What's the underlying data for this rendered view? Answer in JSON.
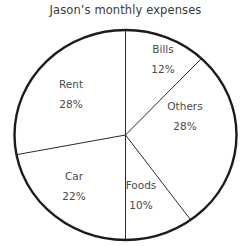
{
  "chart_data": {
    "type": "pie",
    "title": "Jason’s monthly expenses",
    "xlabel": "",
    "ylabel": "",
    "legend": "none",
    "grid": false,
    "start_angle_deg": 0,
    "direction": "clockwise",
    "units": "percent",
    "categories": [
      "Bills",
      "Others",
      "Foods",
      "Car",
      "Rent"
    ],
    "values": [
      12,
      28,
      10,
      22,
      28
    ],
    "value_suffix": "%",
    "total": 100,
    "slices": [
      {
        "name": "Bills",
        "value": 12,
        "value_label": "12%",
        "start_deg": 0,
        "end_deg": 43.2,
        "label_x": 163,
        "label_y": 44,
        "fill": "#ffffff"
      },
      {
        "name": "Others",
        "value": 28,
        "value_label": "28%",
        "start_deg": 43.2,
        "end_deg": 144.0,
        "label_x": 185,
        "label_y": 101,
        "fill": "#ffffff"
      },
      {
        "name": "Foods",
        "value": 10,
        "value_label": "10%",
        "start_deg": 144.0,
        "end_deg": 180.0,
        "label_x": 141,
        "label_y": 180,
        "fill": "#ffffff"
      },
      {
        "name": "Car",
        "value": 22,
        "value_label": "22%",
        "start_deg": 180.0,
        "end_deg": 259.2,
        "label_x": 74,
        "label_y": 171,
        "fill": "#ffffff"
      },
      {
        "name": "Rent",
        "value": 28,
        "value_label": "28%",
        "start_deg": 259.2,
        "end_deg": 360.0,
        "label_x": 71,
        "label_y": 79,
        "fill": "#ffffff"
      }
    ],
    "geometry": {
      "center_x": 125.5,
      "center_y": 135,
      "radius_x": 111,
      "radius_y": 105
    },
    "style": {
      "outline_color": "#1c1c1c",
      "outline_width": 2.4,
      "divider_color": "#2b2b2b",
      "divider_width": 1.0,
      "slice_fill": "#ffffff",
      "background": "#ffffff",
      "text_color": "#4a4a4a",
      "title_color": "#3a3a3a"
    }
  }
}
